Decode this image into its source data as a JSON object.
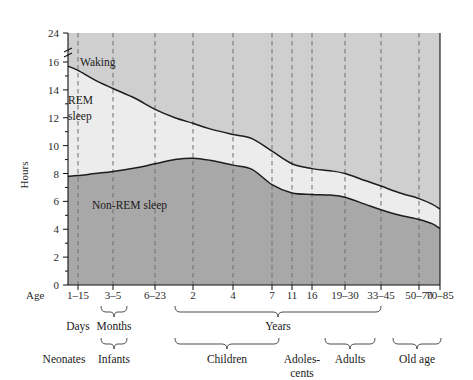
{
  "chart_data": {
    "type": "area",
    "title": "",
    "subtitle": "",
    "xlabel": "Age",
    "ylabel": "Hours",
    "ylim": [
      0,
      24
    ],
    "y_ticks_major": [
      0,
      2,
      4,
      6,
      8,
      10,
      12,
      14,
      16,
      24
    ],
    "y_axis_break": {
      "between": [
        16,
        24
      ],
      "present": true
    },
    "y_minor_tick_step": 1,
    "grid": "vertical dashed gridlines at each age tick",
    "legend": "inline band labels",
    "stacking": "stacked area: Non-REM sleep (bottom), REM sleep (middle), Waking (top to 24h)",
    "x_tick_labels": [
      "1–15",
      "3–5",
      "6–23",
      "2",
      "4",
      "7",
      "11",
      "16",
      "19–30",
      "33–45",
      "50–70",
      "70–85"
    ],
    "x_tick_positions_px": [
      78,
      113,
      155,
      193,
      233,
      272,
      292,
      312,
      345,
      381,
      419,
      440
    ],
    "series": [
      {
        "name": "Non-REM sleep",
        "color": "#a8a8a8",
        "label_position": {
          "x": 95,
          "y": 205
        },
        "points": [
          {
            "x_px": 68,
            "hours": 7.8
          },
          {
            "x_px": 78,
            "hours": 7.85
          },
          {
            "x_px": 95,
            "hours": 8.0
          },
          {
            "x_px": 113,
            "hours": 8.15
          },
          {
            "x_px": 135,
            "hours": 8.4
          },
          {
            "x_px": 155,
            "hours": 8.7
          },
          {
            "x_px": 175,
            "hours": 9.0
          },
          {
            "x_px": 193,
            "hours": 9.1
          },
          {
            "x_px": 210,
            "hours": 8.95
          },
          {
            "x_px": 233,
            "hours": 8.6
          },
          {
            "x_px": 252,
            "hours": 8.3
          },
          {
            "x_px": 272,
            "hours": 7.2
          },
          {
            "x_px": 292,
            "hours": 6.6
          },
          {
            "x_px": 312,
            "hours": 6.5
          },
          {
            "x_px": 330,
            "hours": 6.45
          },
          {
            "x_px": 345,
            "hours": 6.3
          },
          {
            "x_px": 365,
            "hours": 5.8
          },
          {
            "x_px": 381,
            "hours": 5.4
          },
          {
            "x_px": 400,
            "hours": 5.0
          },
          {
            "x_px": 419,
            "hours": 4.7
          },
          {
            "x_px": 432,
            "hours": 4.4
          },
          {
            "x_px": 440,
            "hours": 4.05
          }
        ]
      },
      {
        "name": "REM sleep",
        "color": "#ececec",
        "label_position": {
          "x": 68,
          "y": 104
        },
        "cumulative_top_points": [
          {
            "x_px": 68,
            "hours": 15.7
          },
          {
            "x_px": 78,
            "hours": 15.4
          },
          {
            "x_px": 95,
            "hours": 14.7
          },
          {
            "x_px": 113,
            "hours": 14.1
          },
          {
            "x_px": 135,
            "hours": 13.4
          },
          {
            "x_px": 155,
            "hours": 12.6
          },
          {
            "x_px": 175,
            "hours": 12.0
          },
          {
            "x_px": 193,
            "hours": 11.6
          },
          {
            "x_px": 210,
            "hours": 11.2
          },
          {
            "x_px": 233,
            "hours": 10.8
          },
          {
            "x_px": 252,
            "hours": 10.5
          },
          {
            "x_px": 272,
            "hours": 9.6
          },
          {
            "x_px": 292,
            "hours": 8.7
          },
          {
            "x_px": 312,
            "hours": 8.35
          },
          {
            "x_px": 330,
            "hours": 8.2
          },
          {
            "x_px": 345,
            "hours": 8.0
          },
          {
            "x_px": 365,
            "hours": 7.5
          },
          {
            "x_px": 381,
            "hours": 7.1
          },
          {
            "x_px": 400,
            "hours": 6.6
          },
          {
            "x_px": 419,
            "hours": 6.2
          },
          {
            "x_px": 432,
            "hours": 5.8
          },
          {
            "x_px": 440,
            "hours": 5.45
          }
        ]
      },
      {
        "name": "Waking",
        "color": "#cfcfcf",
        "label_position": {
          "x": 80,
          "y": 62
        },
        "description": "Region above the total-sleep curve up to 24 hours"
      }
    ]
  },
  "yaxis": {
    "title": "Hours",
    "ticks": [
      "24",
      "16",
      "14",
      "12",
      "10",
      "8",
      "6",
      "4",
      "2",
      "0"
    ]
  },
  "xaxis": {
    "prefix_label": "Age",
    "ticks": [
      {
        "label": "1–15"
      },
      {
        "label": "3–5"
      },
      {
        "label": "6–23"
      },
      {
        "label": "2"
      },
      {
        "label": "4"
      },
      {
        "label": "7"
      },
      {
        "label": "11"
      },
      {
        "label": "16"
      },
      {
        "label": "19–30"
      },
      {
        "label": "33–45"
      },
      {
        "label": "50–70"
      },
      {
        "label": "70–85"
      }
    ]
  },
  "unit_groups": [
    {
      "label": "Days",
      "has_bracket": false
    },
    {
      "label": "Months",
      "has_bracket": true
    },
    {
      "label": "Years",
      "has_bracket": true
    }
  ],
  "life_stage_groups": [
    {
      "label": "Neonates",
      "has_bracket": false
    },
    {
      "label": "Infants",
      "has_bracket": true
    },
    {
      "label": "Children",
      "has_bracket": true
    },
    {
      "label": "Adoles-",
      "label2": "cents",
      "has_bracket": false
    },
    {
      "label": "Adults",
      "has_bracket": true
    },
    {
      "label": "Old age",
      "has_bracket": true
    }
  ],
  "bands": {
    "waking": "Waking",
    "rem": "REM",
    "rem2": "sleep",
    "nonrem": "Non-REM sleep"
  },
  "colors": {
    "waking_fill": "#cfcfcf",
    "rem_fill": "#ececec",
    "nonrem_fill": "#a8a8a8",
    "curve_stroke": "#1d1d1d",
    "grid_stroke": "#6f6f6f",
    "axis_stroke": "#111111",
    "background": "#ffffff"
  }
}
